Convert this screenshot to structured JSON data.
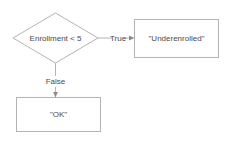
{
  "diagram": {
    "type": "flowchart",
    "background_color": "#ffffff",
    "stroke_color": "#b4b4b4",
    "text_color": "#4a4a4a",
    "nodes": [
      {
        "id": "decision",
        "shape": "diamond",
        "label": "Enrollment < 5"
      },
      {
        "id": "underenrolled",
        "shape": "rectangle",
        "label": "\"Underenrolled\""
      },
      {
        "id": "ok",
        "shape": "rectangle",
        "label": "\"OK\""
      }
    ],
    "edges": [
      {
        "from": "decision",
        "to": "underenrolled",
        "label": "True"
      },
      {
        "from": "decision",
        "to": "ok",
        "label": "False"
      }
    ]
  }
}
